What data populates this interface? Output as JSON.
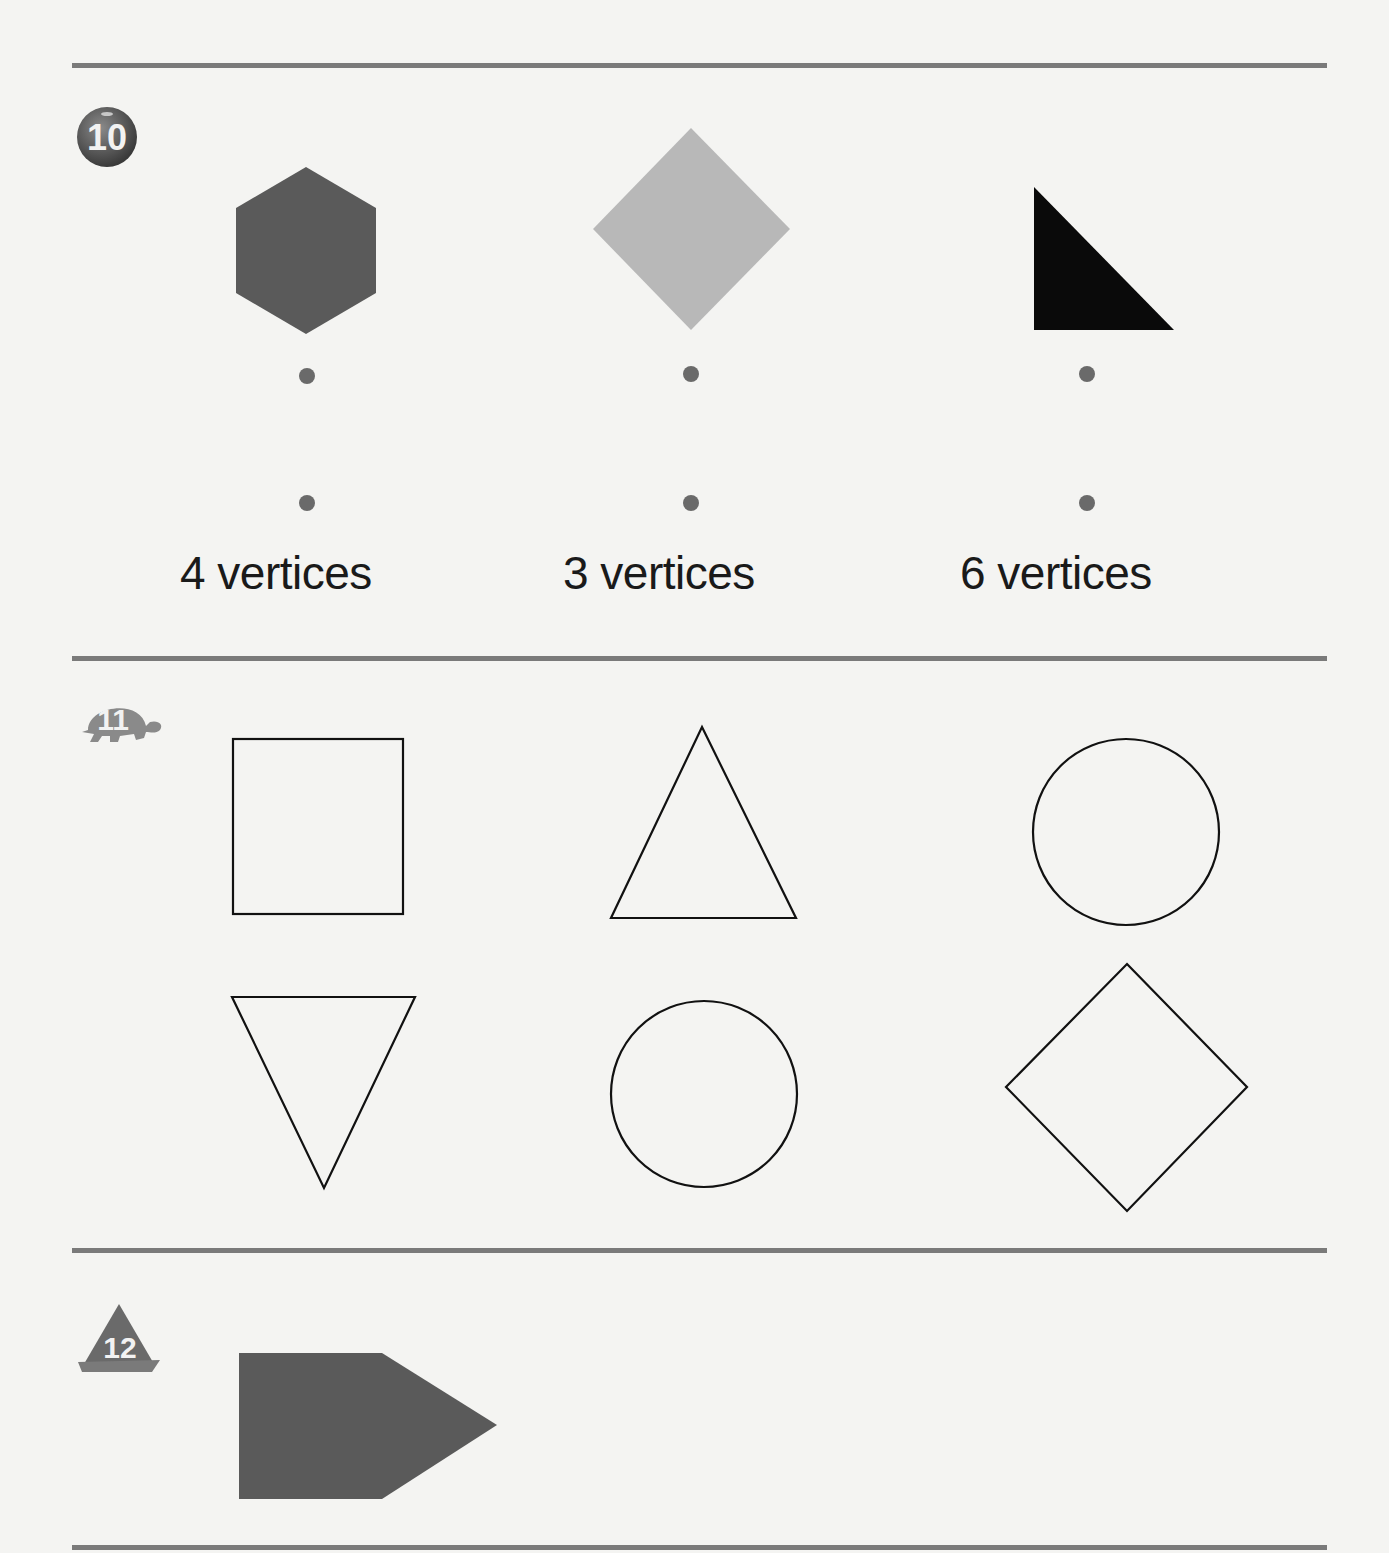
{
  "colors": {
    "rule": "#7a7a7a",
    "shape_dark": "#5a5a5a",
    "shape_light": "#b8b8b8",
    "shape_black": "#0a0a0a",
    "dot": "#6a6a6a",
    "outline": "#111111",
    "paper": "#f4f4f2"
  },
  "problems": [
    {
      "number": "10",
      "badge_icon": "ball-icon",
      "shapes": [
        {
          "name": "hexagon",
          "fill": "dark-gray"
        },
        {
          "name": "diamond",
          "fill": "light-gray"
        },
        {
          "name": "right-triangle",
          "fill": "black"
        }
      ],
      "labels": [
        "4 vertices",
        "3 vertices",
        "6 vertices"
      ]
    },
    {
      "number": "11",
      "badge_icon": "turtle-icon",
      "shapes_top": [
        "square",
        "triangle",
        "circle"
      ],
      "shapes_bottom": [
        "inverted-triangle",
        "circle",
        "diamond"
      ]
    },
    {
      "number": "12",
      "badge_icon": "sailboat-icon",
      "shapes": [
        {
          "name": "pentagon",
          "fill": "dark-gray"
        }
      ]
    }
  ]
}
